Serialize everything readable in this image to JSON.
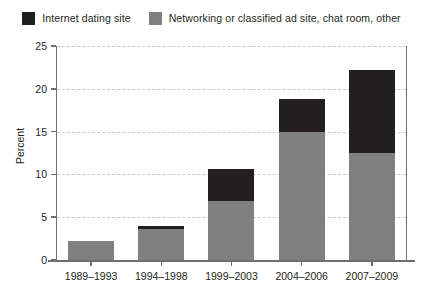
{
  "chart_data": {
    "type": "bar",
    "stacked": true,
    "title": "",
    "xlabel": "",
    "ylabel": "Percent",
    "ylim": [
      0,
      25
    ],
    "yticks": [
      0,
      5,
      10,
      15,
      20,
      25
    ],
    "ytick_labels": [
      "0",
      "5",
      "10",
      "15",
      "20",
      "25"
    ],
    "grid": true,
    "grid_axis": "y",
    "legend_position": "top",
    "categories": [
      "1989–1993",
      "1994–1998",
      "1999–2003",
      "2004–2006",
      "2007–2009"
    ],
    "series": [
      {
        "name": "Internet dating site",
        "color": "#231f20",
        "values": [
          0.0,
          0.4,
          3.7,
          3.8,
          9.7
        ]
      },
      {
        "name": "Networking or classified ad site, chat room, other",
        "color": "#808080",
        "values": [
          2.2,
          3.6,
          6.9,
          15.0,
          12.5
        ]
      }
    ],
    "totals": [
      2.2,
      4.0,
      10.6,
      18.8,
      22.2
    ]
  },
  "legend": {
    "entries": [
      {
        "label": "Internet dating site",
        "color": "#231f20"
      },
      {
        "label": "Networking or classified ad site, chat room, other",
        "color": "#808080"
      }
    ]
  },
  "axes": {
    "y_title": "Percent"
  }
}
